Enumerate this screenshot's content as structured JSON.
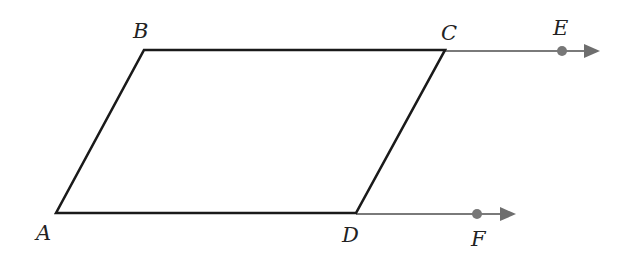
{
  "diagram": {
    "type": "parallelogram-with-rays",
    "colors": {
      "shape_stroke": "#1a1a1a",
      "ray": "#7a7a7a",
      "point": "#777777"
    },
    "vertices": {
      "A": {
        "label": "A",
        "x": 56,
        "y": 213
      },
      "B": {
        "label": "B",
        "x": 144,
        "y": 50
      },
      "C": {
        "label": "C",
        "x": 445,
        "y": 50
      },
      "D": {
        "label": "D",
        "x": 356,
        "y": 213
      }
    },
    "rays": [
      {
        "from": "C",
        "through_point": {
          "label": "E",
          "x": 562,
          "y": 51
        },
        "end_x": 598
      },
      {
        "from": "D",
        "through_point": {
          "label": "F",
          "x": 477,
          "y": 214
        },
        "end_x": 514
      }
    ],
    "labels": {
      "A": "A",
      "B": "B",
      "C": "C",
      "D": "D",
      "E": "E",
      "F": "F"
    }
  }
}
